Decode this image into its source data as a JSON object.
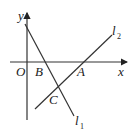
{
  "diagram": {
    "type": "coordinate-geometry",
    "axes": {
      "x_label": "x",
      "y_label": "y",
      "origin_label": "O"
    },
    "points": [
      {
        "label": "O",
        "desc": "origin"
      },
      {
        "label": "B",
        "desc": "l1 intersects x-axis"
      },
      {
        "label": "A",
        "desc": "l2 intersects x-axis"
      },
      {
        "label": "C",
        "desc": "intersection of l1 and l2"
      }
    ],
    "lines": [
      {
        "name": "l1",
        "letter": "l",
        "sub": "1",
        "slope": "negative"
      },
      {
        "name": "l2",
        "letter": "l",
        "sub": "2",
        "slope": "positive"
      }
    ]
  },
  "labels": {
    "x": "x",
    "y": "y",
    "O": "O",
    "A": "A",
    "B": "B",
    "C": "C",
    "l": "l",
    "sub1": "1",
    "sub2": "2"
  }
}
